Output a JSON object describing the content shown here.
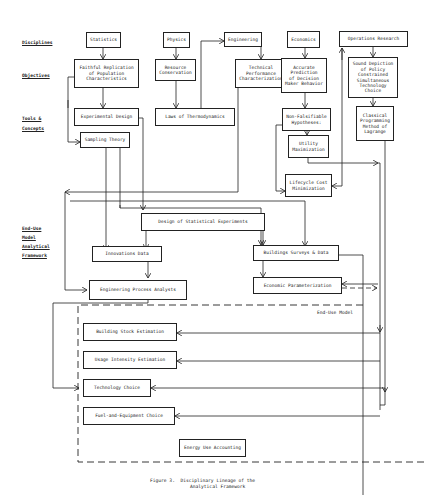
{
  "row_labels": {
    "disciplines": "Disciplines",
    "objectives": "Objectives",
    "tools_1": "Tools &",
    "tools_2": "Concepts",
    "enduse_1": "End-Use",
    "enduse_2": "Model",
    "enduse_3": "Analytical",
    "enduse_4": "Framework"
  },
  "disciplines": {
    "statistics": "Statistics",
    "physics": "Physics",
    "engineering": "Engineering",
    "economics": "Economics",
    "operations_research": "Operations Research"
  },
  "objectives": {
    "faithful_replication": "Faithful Replication\nof Population\nCharacteristics",
    "resource_conservation": "Resource\nConservation",
    "technical_performance": "Technical\nPerformance\nCharacterization",
    "accurate_prediction": "Accurate\nPrediction\nof Decision\nMaker Behavior",
    "sound_depiction": "Sound Depiction\nof Policy\nConstrained\nSimultaneous\nTechnology Choice"
  },
  "tools": {
    "experimental_design": "Experimental Design",
    "sampling_theory": "Sampling Theory",
    "laws_thermo": "Laws of Thermodynamics",
    "non_falsifiable": "Non-Falsifiable\nHypotheses:",
    "utility_max": "Utility\nMaximization",
    "lifecycle_cost": "Lifecycle Cost\nMinimization",
    "classical_programming": "Classical\nProgramming\nMethod of\nLagrange"
  },
  "framework": {
    "design_stat_experiments": "Design of Statistical Experiments",
    "innovations_data": "Innovations Data",
    "buildings_surveys": "Buildings Surveys & Data",
    "engineering_process": "Engineering Process Analysts",
    "economic_param": "Economic Parameterization"
  },
  "end_use_model": {
    "title": "End-Use Model",
    "building_stock": "Building Stock Estimation",
    "usage_intensity": "Usage Intensity Estimation",
    "technology_choice": "Technology Choice",
    "fuel_equipment": "Fuel-and-Equipment Choice",
    "energy_accounting": "Energy Use Accounting"
  },
  "caption": {
    "line1": "Figure 3.  Disciplinary Lineage of the",
    "line2": "Analytical Framework"
  }
}
